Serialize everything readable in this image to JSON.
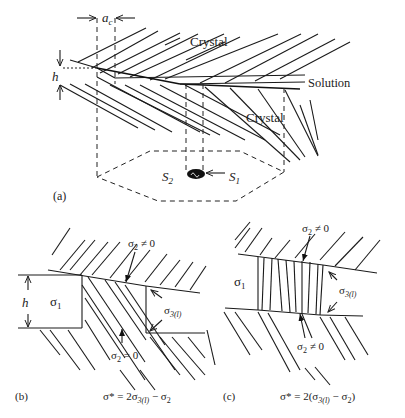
{
  "panel_a": {
    "tag": "(a)",
    "labels": {
      "ac": "a",
      "ac_sub": "c",
      "h": "h",
      "crystal_top": "Crystal",
      "solution": "Solution",
      "crystal_bottom": "Crystal",
      "s2": "S",
      "s2_sub": "2",
      "s1": "S",
      "s1_sub": "1"
    }
  },
  "panel_b": {
    "tag": "(b)",
    "labels": {
      "h": "h",
      "sigma1": "σ",
      "sigma1_sub": "1",
      "sigma2_neq": "σ",
      "sigma2_neq_sub": "2",
      "sigma2_neq_rel": " ≠ 0",
      "sigma3": "σ",
      "sigma3_sub": "3(l)",
      "sigma2_eq": "σ",
      "sigma2_eq_sub": "2",
      "sigma2_eq_rel": " = 0"
    },
    "formula": {
      "lhs": "σ* = 2σ",
      "sub": "3(l)",
      "rhs": " − σ",
      "sub2": "2"
    }
  },
  "panel_c": {
    "tag": "(c)",
    "labels": {
      "sigma1": "σ",
      "sigma1_sub": "1",
      "sigma2_top": "σ",
      "sigma2_top_sub": "2",
      "sigma2_top_rel": " ≠ 0",
      "sigma3": "σ",
      "sigma3_sub": "3(l)",
      "sigma2_bot": "σ",
      "sigma2_bot_sub": "2",
      "sigma2_bot_rel": " ≠ 0"
    },
    "formula": {
      "lhs": "σ* = 2(σ",
      "sub": "3(l)",
      "rhs": " − σ",
      "sub2": "2",
      "close": ")"
    }
  }
}
